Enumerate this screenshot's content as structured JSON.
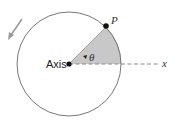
{
  "diagram": {
    "labels": {
      "axis": "Axis",
      "point": "P",
      "angle": "θ",
      "x_axis": "x"
    },
    "colors": {
      "circle": "#555555",
      "sector_fill": "#c8c8c8",
      "dashed_line": "#888888",
      "arrow": "#9a9a9a",
      "dots": "#111111"
    },
    "rotation_direction": "counterclockwise"
  }
}
